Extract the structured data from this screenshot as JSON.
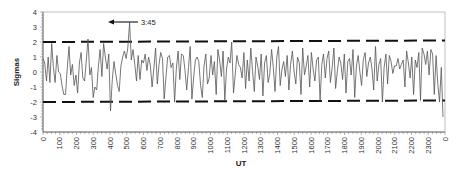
{
  "chart_data": {
    "type": "line",
    "title": "",
    "xlabel": "UT",
    "ylabel": "Sigmas",
    "ylim": [
      -4,
      4
    ],
    "yticks": [
      "4",
      "3",
      "2",
      "1",
      "0",
      "-1",
      "-2",
      "-3",
      "-4"
    ],
    "xticks": [
      "0",
      "100",
      "200",
      "300",
      "400",
      "500",
      "600",
      "700",
      "800",
      "900",
      "1000",
      "1100",
      "1200",
      "1300",
      "1400",
      "1500",
      "1600",
      "1700",
      "1800",
      "1900",
      "2000",
      "2100",
      "2200",
      "2300",
      "0"
    ],
    "grid": false,
    "legend": null,
    "threshold_lines": [
      {
        "name": "upper",
        "style": "dashed",
        "y_start": 2.0,
        "y_end": 2.1
      },
      {
        "name": "lower",
        "style": "dashed",
        "y_start": -2.0,
        "y_end": -1.9
      }
    ],
    "annotations": [
      {
        "text": "3:45",
        "points_to_x": 345,
        "points_to_y": 3.3,
        "arrow": true
      }
    ],
    "series": [
      {
        "name": "Sigmas",
        "x_step": 10,
        "values": [
          0.9,
          0.6,
          -0.6,
          1.0,
          -0.7,
          1.9,
          0.3,
          -0.7,
          1.1,
          0.0,
          -0.1,
          -0.9,
          -1.5,
          -1.5,
          0.2,
          1.7,
          -0.2,
          0.5,
          -0.9,
          -0.2,
          -1.4,
          0.6,
          1.3,
          -0.4,
          -0.6,
          0.8,
          2.2,
          -0.2,
          0.3,
          -1.7,
          -1.0,
          -1.2,
          0.4,
          1.5,
          -0.3,
          1.9,
          1.0,
          0.2,
          1.2,
          -2.6,
          -0.5,
          0.7,
          -0.1,
          -0.9,
          -1.3,
          0.4,
          1.0,
          1.4,
          0.9,
          1.6,
          3.3,
          0.8,
          1.5,
          0.5,
          -0.6,
          1.1,
          -0.5,
          0.8,
          0.6,
          1.2,
          0.1,
          1.0,
          0.4,
          -1.0,
          0.2,
          1.6,
          -0.8,
          0.5,
          1.3,
          0.9,
          -1.8,
          -0.4,
          1.0,
          1.1,
          0.3,
          0.6,
          -2.0,
          0.2,
          1.4,
          -0.5,
          1.2,
          1.1,
          0.1,
          -1.2,
          0.3,
          1.7,
          -1.8,
          -0.4,
          0.8,
          1.0,
          0.7,
          -0.9,
          -1.7,
          0.4,
          1.2,
          -0.8,
          -0.4,
          1.1,
          -0.2,
          0.7,
          -1.5,
          1.5,
          0.8,
          -0.3,
          1.4,
          -1.9,
          0.2,
          1.0,
          0.6,
          2.0,
          -1.4,
          -0.2,
          1.1,
          0.5,
          0.3,
          -0.4,
          1.3,
          -1.1,
          0.8,
          -0.6,
          1.6,
          0.1,
          -1.3,
          1.0,
          0.4,
          -0.5,
          1.2,
          -1.6,
          0.6,
          1.1,
          -0.7,
          -0.1,
          1.5,
          0.3,
          -1.3,
          1.0,
          1.7,
          -0.9,
          0.2,
          0.7,
          -0.3,
          1.1,
          -1.2,
          0.5,
          1.4,
          0.0,
          -0.8,
          1.0,
          0.6,
          -1.5,
          1.6,
          -0.2,
          0.4,
          1.1,
          -1.0,
          1.3,
          0.2,
          -0.6,
          0.8,
          1.0,
          -1.9,
          0.5,
          1.2,
          -0.4,
          0.9,
          1.4,
          -0.7,
          0.3,
          1.6,
          -1.1,
          0.1,
          1.0,
          0.6,
          -0.5,
          1.2,
          -1.4,
          0.7,
          0.9,
          -0.2,
          1.5,
          -1.7,
          0.4,
          1.1,
          0.0,
          -0.9,
          0.8,
          1.3,
          -0.3,
          0.6,
          1.0,
          0.2,
          -1.2,
          1.7,
          -0.6,
          0.5,
          0.9,
          -2.0,
          0.3,
          1.2,
          -0.8,
          1.1,
          0.7,
          -0.1,
          0.4,
          0.4,
          0.9,
          0.2,
          0.5,
          0.8,
          -1.0,
          1.4,
          0.6,
          -0.4,
          1.0,
          -1.5,
          0.8,
          0.3,
          1.3,
          -1.9,
          1.6,
          1.2,
          0.5,
          1.4,
          -0.2,
          1.5,
          1.2,
          -1.5,
          1.1,
          -0.8,
          -2.0,
          0.3,
          -3.0
        ]
      }
    ]
  }
}
